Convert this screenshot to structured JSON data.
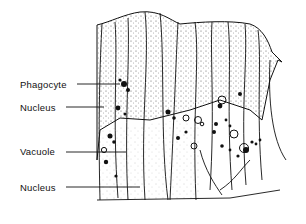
{
  "figure": {
    "labels": [
      {
        "id": "phagocyte",
        "text": "Phagocyte",
        "x": 20,
        "y": 79,
        "line_from": [
          77,
          84
        ],
        "line_to": [
          120,
          84
        ]
      },
      {
        "id": "nucleus-top",
        "text": "Nucleus",
        "x": 20,
        "y": 102,
        "line_from": [
          66,
          107
        ],
        "line_to": [
          104,
          107
        ]
      },
      {
        "id": "vacuole",
        "text": "Vacuole",
        "x": 20,
        "y": 146,
        "line_from": [
          66,
          152
        ],
        "line_to": [
          126,
          152
        ]
      },
      {
        "id": "nucleus-bottom",
        "text": "Nucleus",
        "x": 20,
        "y": 182,
        "line_from": [
          66,
          187
        ],
        "line_to": [
          140,
          187
        ]
      }
    ],
    "colors": {
      "ink": "#111111",
      "background": "#ffffff",
      "stipple": "#555555"
    }
  }
}
